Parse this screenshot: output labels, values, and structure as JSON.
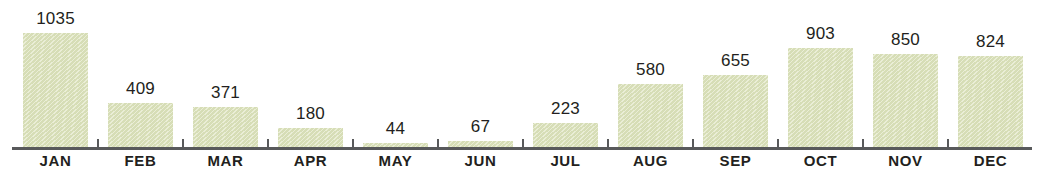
{
  "chart_data": {
    "type": "bar",
    "title": "",
    "subtitle": "",
    "xlabel": "",
    "ylabel": "",
    "ylim": [
      0,
      1035
    ],
    "grid": false,
    "legend": false,
    "axis_visible": {
      "x": true,
      "y": false
    },
    "bar_color": "#dde3bd",
    "axis_color": "#58595b",
    "label_color": "#231f20",
    "categories": [
      "JAN",
      "FEB",
      "MAR",
      "APR",
      "MAY",
      "JUN",
      "JUL",
      "AUG",
      "SEP",
      "OCT",
      "NOV",
      "DEC"
    ],
    "values": [
      1035,
      409,
      371,
      180,
      44,
      67,
      223,
      580,
      655,
      903,
      850,
      824
    ],
    "data_labels": [
      "1035",
      "409",
      "371",
      "180",
      "44",
      "67",
      "223",
      "580",
      "655",
      "903",
      "850",
      "824"
    ]
  }
}
